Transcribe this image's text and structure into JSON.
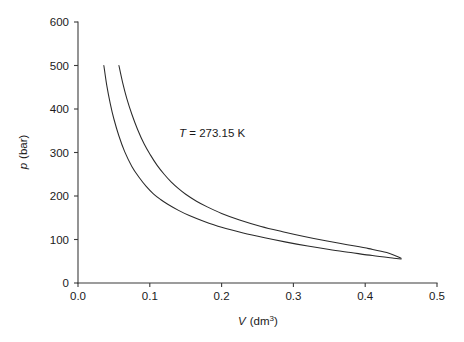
{
  "chart_data": {
    "type": "line",
    "title": "",
    "xlabel": "V (dm3)",
    "xlabel_symbol": "V",
    "xlabel_unit_base": "(dm",
    "xlabel_unit_exp": "3",
    "xlabel_unit_close": ")",
    "ylabel": "p (bar)",
    "ylabel_symbol": "p",
    "ylabel_unit": "(bar)",
    "xlim": [
      0.0,
      0.5
    ],
    "ylim": [
      0,
      600
    ],
    "grid": false,
    "legend": "none",
    "xticks": [
      0.0,
      0.1,
      0.2,
      0.3,
      0.4,
      0.5
    ],
    "xtick_labels": [
      "0.0",
      "0.1",
      "0.2",
      "0.3",
      "0.4",
      "0.5"
    ],
    "yticks": [
      0,
      100,
      200,
      300,
      400,
      500,
      600
    ],
    "ytick_labels": [
      "0",
      "100",
      "200",
      "300",
      "400",
      "500",
      "600"
    ],
    "annotations": [
      {
        "name": "temperature-annotation",
        "symbol": "T",
        "equals": " = ",
        "value": "273.15 K",
        "full_text": "T = 273.15 K",
        "x": 0.145,
        "y": 330
      }
    ],
    "series": [
      {
        "name": "curve-left",
        "points": [
          [
            0.036,
            500
          ],
          [
            0.04,
            455
          ],
          [
            0.045,
            412
          ],
          [
            0.05,
            377
          ],
          [
            0.057,
            338
          ],
          [
            0.065,
            302
          ],
          [
            0.075,
            268
          ],
          [
            0.085,
            243
          ],
          [
            0.095,
            222
          ],
          [
            0.105,
            205
          ],
          [
            0.115,
            192
          ],
          [
            0.125,
            181
          ],
          [
            0.14,
            167
          ],
          [
            0.155,
            155
          ],
          [
            0.175,
            142
          ],
          [
            0.2,
            128
          ],
          [
            0.23,
            115
          ],
          [
            0.26,
            104
          ],
          [
            0.29,
            94
          ],
          [
            0.32,
            85
          ],
          [
            0.35,
            77
          ],
          [
            0.38,
            70
          ],
          [
            0.41,
            63
          ],
          [
            0.44,
            57
          ],
          [
            0.45,
            55
          ]
        ]
      },
      {
        "name": "curve-right",
        "points": [
          [
            0.057,
            500
          ],
          [
            0.062,
            462
          ],
          [
            0.068,
            424
          ],
          [
            0.075,
            388
          ],
          [
            0.083,
            353
          ],
          [
            0.092,
            320
          ],
          [
            0.101,
            294
          ],
          [
            0.11,
            271
          ],
          [
            0.12,
            250
          ],
          [
            0.13,
            232
          ],
          [
            0.14,
            217
          ],
          [
            0.15,
            204
          ],
          [
            0.165,
            188
          ],
          [
            0.18,
            175
          ],
          [
            0.2,
            160
          ],
          [
            0.225,
            145
          ],
          [
            0.255,
            130
          ],
          [
            0.285,
            118
          ],
          [
            0.315,
            107
          ],
          [
            0.345,
            97
          ],
          [
            0.375,
            88
          ],
          [
            0.405,
            79
          ],
          [
            0.43,
            70
          ],
          [
            0.45,
            57
          ]
        ]
      }
    ]
  },
  "plot_geometry": {
    "left_px": 78,
    "right_px": 437,
    "top_px": 22,
    "bottom_px": 283
  }
}
